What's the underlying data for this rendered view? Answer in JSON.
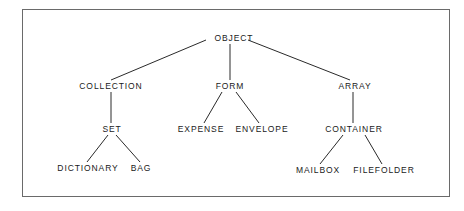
{
  "diagram": {
    "type": "class-hierarchy-tree",
    "nodes": [
      {
        "id": "object",
        "label": "OBJECT",
        "x": 234,
        "y": 38
      },
      {
        "id": "collection",
        "label": "COLLECTION",
        "x": 111,
        "y": 86
      },
      {
        "id": "form",
        "label": "FORM",
        "x": 230,
        "y": 86
      },
      {
        "id": "array",
        "label": "ARRAY",
        "x": 355,
        "y": 86
      },
      {
        "id": "set",
        "label": "SET",
        "x": 112,
        "y": 129
      },
      {
        "id": "expense",
        "label": "EXPENSE",
        "x": 201,
        "y": 129
      },
      {
        "id": "envelope",
        "label": "ENVELOPE",
        "x": 262,
        "y": 129
      },
      {
        "id": "container",
        "label": "CONTAINER",
        "x": 354,
        "y": 129
      },
      {
        "id": "dictionary",
        "label": "DICTIONARY",
        "x": 88,
        "y": 168
      },
      {
        "id": "bag",
        "label": "BAG",
        "x": 141,
        "y": 168
      },
      {
        "id": "mailbox",
        "label": "MAILBOX",
        "x": 318,
        "y": 170
      },
      {
        "id": "filefolder",
        "label": "FILEFOLDER",
        "x": 384,
        "y": 170
      }
    ],
    "edges": [
      {
        "from": "object",
        "to": "collection",
        "x1": 206,
        "y1": 40,
        "x2": 111,
        "y2": 80
      },
      {
        "from": "object",
        "to": "form",
        "x1": 230,
        "y1": 44,
        "x2": 230,
        "y2": 80
      },
      {
        "from": "object",
        "to": "array",
        "x1": 248,
        "y1": 40,
        "x2": 350,
        "y2": 80
      },
      {
        "from": "collection",
        "to": "set",
        "x1": 111,
        "y1": 92,
        "x2": 111,
        "y2": 123
      },
      {
        "from": "form",
        "to": "expense",
        "x1": 222,
        "y1": 92,
        "x2": 204,
        "y2": 123
      },
      {
        "from": "form",
        "to": "envelope",
        "x1": 236,
        "y1": 92,
        "x2": 259,
        "y2": 123
      },
      {
        "from": "array",
        "to": "container",
        "x1": 353,
        "y1": 92,
        "x2": 353,
        "y2": 123
      },
      {
        "from": "set",
        "to": "dictionary",
        "x1": 108,
        "y1": 135,
        "x2": 87,
        "y2": 162
      },
      {
        "from": "set",
        "to": "bag",
        "x1": 116,
        "y1": 135,
        "x2": 140,
        "y2": 162
      },
      {
        "from": "container",
        "to": "mailbox",
        "x1": 343,
        "y1": 135,
        "x2": 320,
        "y2": 164
      },
      {
        "from": "container",
        "to": "filefolder",
        "x1": 365,
        "y1": 135,
        "x2": 382,
        "y2": 164
      }
    ]
  }
}
